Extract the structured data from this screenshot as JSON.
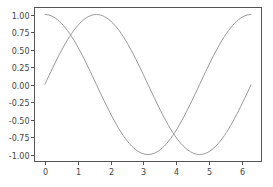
{
  "chart_data": {
    "type": "line",
    "title": "",
    "xlabel": "",
    "ylabel": "",
    "xlim": [
      -0.314,
      6.597
    ],
    "ylim": [
      -1.1,
      1.1
    ],
    "grid": false,
    "legend": null,
    "xticks": [
      0,
      1,
      2,
      3,
      4,
      5,
      6
    ],
    "xtick_labels": [
      "0",
      "1",
      "2",
      "3",
      "4",
      "5",
      "6"
    ],
    "yticks": [
      1.0,
      0.75,
      0.5,
      0.25,
      0.0,
      -0.25,
      -0.5,
      -0.75,
      -1.0
    ],
    "ytick_labels": [
      "1.00",
      "0.75",
      "0.50",
      "0.25",
      "0.00",
      "-0.25",
      "-0.50",
      "-0.75",
      "-1.00"
    ],
    "series": [
      {
        "name": "sin(x)",
        "function": "sin",
        "x": [
          0,
          0.785,
          1.571,
          2.356,
          3.142,
          3.927,
          4.712,
          5.498,
          6.283
        ],
        "values": [
          0.0,
          0.707,
          1.0,
          0.707,
          0.0,
          -0.707,
          -1.0,
          -0.707,
          0.0
        ],
        "color": "#999999"
      },
      {
        "name": "cos(x)",
        "function": "cos",
        "x": [
          0,
          0.785,
          1.571,
          2.356,
          3.142,
          3.927,
          4.712,
          5.498,
          6.283
        ],
        "values": [
          1.0,
          0.707,
          0.0,
          -0.707,
          -1.0,
          -0.707,
          0.0,
          0.707,
          1.0
        ],
        "color": "#999999"
      }
    ],
    "x_domain": [
      0,
      6.283
    ],
    "samples": 100
  },
  "style": {
    "frame_color": "#555555",
    "tick_color": "#555555",
    "label_color": "#444444"
  }
}
